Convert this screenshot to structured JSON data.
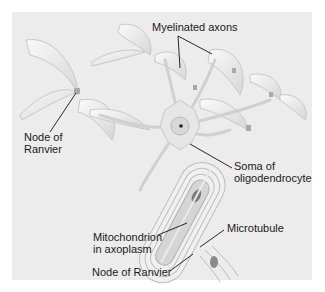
{
  "figure": {
    "background_color": "#ececec",
    "labels": {
      "myelinated_axons": "Myelinated axons",
      "node_of_ranvier_left_line1": "Node of",
      "node_of_ranvier_left_line2": "Ranvier",
      "soma_line1": "Soma of",
      "soma_line2": "oligodendrocyte",
      "microtubule": "Microtubule",
      "mitochondrion_line1": "Mitochondrion",
      "mitochondrion_line2": "in axoplasm",
      "node_of_ranvier_bottom": "Node of Ranvier"
    }
  }
}
